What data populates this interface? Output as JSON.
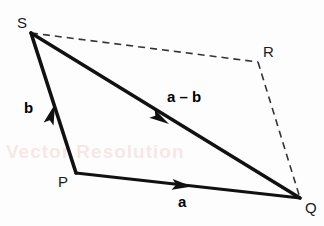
{
  "figure": {
    "background_color": "#fdfdfd",
    "stroke_color": "#111111",
    "dashed_color": "#333333",
    "watermark_color": "#e29696",
    "watermark_text": "Vector Resolution"
  },
  "vertices": [
    {
      "id": "S",
      "label": "S",
      "x": 31,
      "y": 33,
      "label_x": 17,
      "label_y": 16
    },
    {
      "id": "P",
      "label": "P",
      "x": 76,
      "y": 173,
      "label_x": 58,
      "label_y": 174
    },
    {
      "id": "Q",
      "label": "Q",
      "x": 300,
      "y": 198,
      "label_x": 305,
      "label_y": 200
    },
    {
      "id": "R",
      "label": "R",
      "x": 258,
      "y": 62,
      "label_x": 263,
      "label_y": 45
    }
  ],
  "vector_labels": [
    {
      "id": "b",
      "text": "b",
      "x": 24,
      "y": 101,
      "desc": "vector b from P to S"
    },
    {
      "id": "a-minus-b",
      "text": "a – b",
      "x": 167,
      "y": 89,
      "desc": "vector a minus b from S to Q"
    },
    {
      "id": "a",
      "text": "a",
      "x": 177,
      "y": 194,
      "desc": "vector a from P to Q"
    }
  ],
  "segments": [
    {
      "id": "SP",
      "from": "S",
      "to": "P",
      "style": "solid",
      "width": 3.4,
      "arrow": true
    },
    {
      "id": "SQ",
      "from": "S",
      "to": "Q",
      "style": "solid",
      "width": 3.4,
      "arrow": true
    },
    {
      "id": "PQ",
      "from": "P",
      "to": "Q",
      "style": "solid",
      "width": 3.0,
      "arrow": true
    },
    {
      "id": "SR",
      "from": "S",
      "to": "R",
      "style": "dashed",
      "width": 1.6,
      "arrow": false
    },
    {
      "id": "RQ",
      "from": "R",
      "to": "Q",
      "style": "dashed",
      "width": 1.6,
      "arrow": false
    }
  ],
  "arrowheads": [
    {
      "id": "arrow-b",
      "on": "SP",
      "tip_x": 55,
      "tip_y": 103,
      "angle_deg": -72,
      "desc": "arrowhead pointing toward S"
    },
    {
      "id": "arrow-a-minus-b",
      "on": "SQ",
      "tip_x": 168,
      "tip_y": 123,
      "angle_deg": 33,
      "desc": "arrowhead pointing toward Q"
    },
    {
      "id": "arrow-a",
      "on": "PQ",
      "tip_x": 191,
      "tip_y": 186,
      "angle_deg": 6,
      "desc": "arrowhead pointing toward Q"
    }
  ]
}
